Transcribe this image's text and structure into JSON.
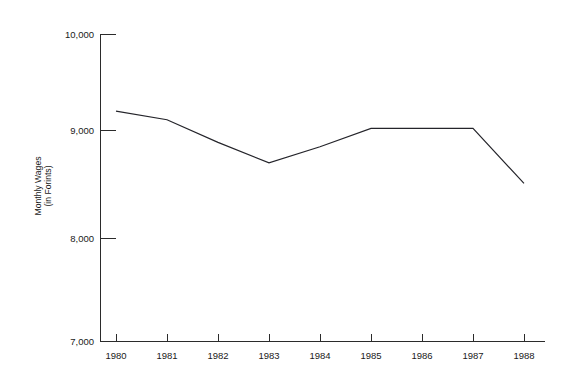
{
  "chart_data": {
    "type": "line",
    "title": "",
    "xlabel": "",
    "ylabel": "Monthly Wages (in Forints)",
    "ylabel_lines": [
      "Monthly Wages",
      "(in Forints)"
    ],
    "categories": [
      "1980",
      "1981",
      "1982",
      "1983",
      "1984",
      "1985",
      "1986",
      "1987",
      "1988"
    ],
    "x": [
      1980,
      1981,
      1982,
      1983,
      1984,
      1985,
      1986,
      1987,
      1988
    ],
    "values": [
      9180,
      9100,
      8890,
      8700,
      8850,
      9020,
      9020,
      9020,
      8510
    ],
    "series": [
      {
        "name": "Monthly Wages",
        "values": [
          9180,
          9100,
          8890,
          8700,
          8850,
          9020,
          9020,
          9020,
          8510
        ]
      }
    ],
    "ylim": [
      7000,
      10000
    ],
    "yticks": [
      7000,
      8000,
      9000,
      10000
    ],
    "ytick_labels": [
      "7,000",
      "8,000",
      "9,000",
      "10,000"
    ],
    "xtick_labels": [
      "1980",
      "1981",
      "1982",
      "1983",
      "1984",
      "1985",
      "1986",
      "1987",
      "1988"
    ],
    "grid": false,
    "legend": false,
    "legend_position": "none",
    "line_color": "#24242a",
    "axis_color": "#2b2b2b",
    "background_color": "#ffffff"
  }
}
